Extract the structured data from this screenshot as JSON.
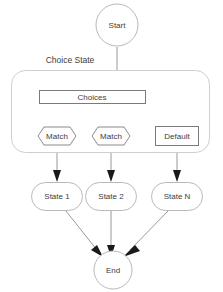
{
  "diagram": {
    "colors": {
      "background": "#ffffff",
      "node_stroke": "#b9b9b9",
      "box_stroke": "#7a7a7a",
      "group_stroke": "#cfcfcf",
      "edge_stroke": "#9a9a9a",
      "arrow_fill": "#1a1a1a",
      "text": "#3d3d3d"
    },
    "group": {
      "label": "Choice State"
    },
    "nodes": {
      "start": {
        "label": "Start",
        "shape": "circle"
      },
      "choices": {
        "label": "Choices",
        "shape": "rectangle"
      },
      "match_1": {
        "label": "Match",
        "shape": "hexagon"
      },
      "match_2": {
        "label": "Match",
        "shape": "hexagon"
      },
      "default": {
        "label": "Default",
        "shape": "rectangle"
      },
      "state_1": {
        "label": "State 1",
        "shape": "rounded-rectangle"
      },
      "state_2": {
        "label": "State 2",
        "shape": "rounded-rectangle"
      },
      "state_n": {
        "label": "State N",
        "shape": "rounded-rectangle"
      },
      "end": {
        "label": "End",
        "shape": "circle"
      }
    },
    "edges": [
      {
        "from": "start",
        "to": "choices"
      },
      {
        "from": "choices",
        "to": "match_1"
      },
      {
        "from": "choices",
        "to": "match_2"
      },
      {
        "from": "match_1",
        "to": "state_1"
      },
      {
        "from": "match_2",
        "to": "state_2"
      },
      {
        "from": "default",
        "to": "state_n"
      },
      {
        "from": "state_1",
        "to": "end"
      },
      {
        "from": "state_2",
        "to": "end"
      },
      {
        "from": "state_n",
        "to": "end"
      }
    ]
  }
}
